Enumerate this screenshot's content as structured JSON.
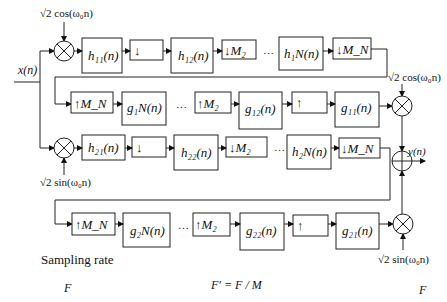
{
  "diagram": {
    "input": "x(n)",
    "output": "y(n)",
    "carriers": {
      "top_cos": "√2 cos(ω₀n)",
      "right_cos": "√2 cos(ω₀n)",
      "left_sin": "√2 sin(ω₀n)",
      "right_sin": "√2 sin(ω₀n)"
    },
    "row1": {
      "blocks": [
        "h₁₁(n)",
        "↓",
        "h₁₂(n)",
        "↓M₂",
        "…",
        "h₁N(n)",
        "↓M_N"
      ]
    },
    "row2": {
      "blocks": [
        "↑M_N",
        "g₁N(n)",
        "…",
        "↑M₂",
        "g₁₂(n)",
        "↑",
        "g₁₁(n)"
      ]
    },
    "row3": {
      "blocks": [
        "h₂₁(n)",
        "↓",
        "h₂₂(n)",
        "↓M₂",
        "…",
        "h₂N(n)",
        "↓M_N"
      ]
    },
    "row4": {
      "blocks": [
        "↑M_N",
        "g₂N(n)",
        "…",
        "↑M₂",
        "g₂₂(n)",
        "↑",
        "g₂₁(n)"
      ]
    },
    "sampling": {
      "title": "Sampling rate",
      "left": "F",
      "middle": "F′ = F / M",
      "right": "F"
    }
  }
}
